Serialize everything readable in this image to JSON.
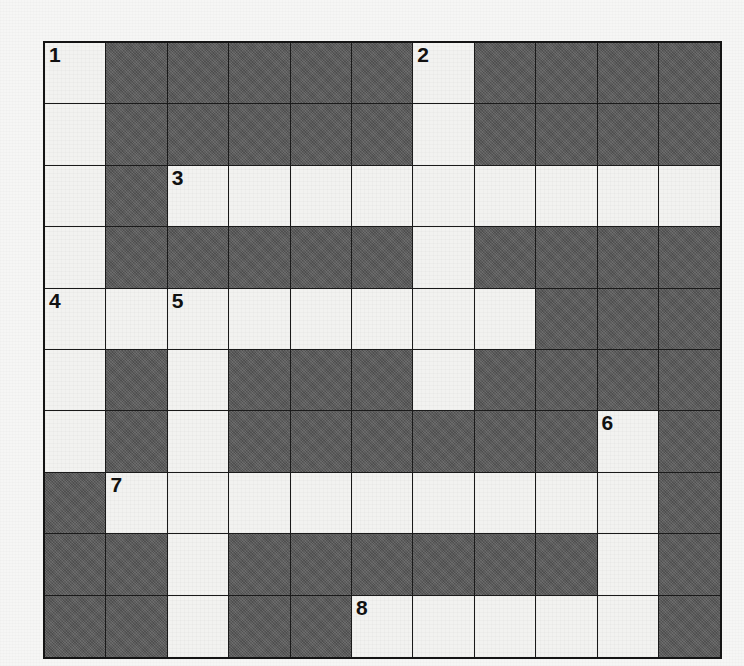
{
  "puzzle": {
    "kind": "crossword-grid",
    "rows": 10,
    "cols": 11,
    "cell_size_px": 61.4,
    "colors": {
      "open_cell": "#f2f2f0",
      "block_cell": "#595959",
      "grid_line": "#1a1a1a",
      "outer_border": "#141414",
      "page_background": "#f6f6f5",
      "number_text": "#111111"
    },
    "legend": {
      "open": "letter cell (white)",
      "block": "blocked cell (dark gray)"
    },
    "grid": [
      [
        "open",
        "block",
        "block",
        "block",
        "block",
        "block",
        "open",
        "block",
        "block",
        "block",
        "block"
      ],
      [
        "open",
        "block",
        "block",
        "block",
        "block",
        "block",
        "open",
        "block",
        "block",
        "block",
        "block"
      ],
      [
        "open",
        "block",
        "open",
        "open",
        "open",
        "open",
        "open",
        "open",
        "open",
        "open",
        "open"
      ],
      [
        "open",
        "block",
        "block",
        "block",
        "block",
        "block",
        "open",
        "block",
        "block",
        "block",
        "block"
      ],
      [
        "open",
        "open",
        "open",
        "open",
        "open",
        "open",
        "open",
        "open",
        "block",
        "block",
        "block"
      ],
      [
        "open",
        "block",
        "open",
        "block",
        "block",
        "block",
        "open",
        "block",
        "block",
        "block",
        "block"
      ],
      [
        "open",
        "block",
        "open",
        "block",
        "block",
        "block",
        "block",
        "block",
        "block",
        "open",
        "block"
      ],
      [
        "block",
        "open",
        "open",
        "open",
        "open",
        "open",
        "open",
        "open",
        "open",
        "open",
        "block"
      ],
      [
        "block",
        "block",
        "open",
        "block",
        "block",
        "block",
        "block",
        "block",
        "block",
        "open",
        "block"
      ],
      [
        "block",
        "block",
        "open",
        "block",
        "block",
        "open",
        "open",
        "open",
        "open",
        "open",
        "block"
      ]
    ],
    "clue_numbers": [
      {
        "number": "1",
        "row": 0,
        "col": 0
      },
      {
        "number": "2",
        "row": 0,
        "col": 6
      },
      {
        "number": "3",
        "row": 2,
        "col": 2
      },
      {
        "number": "4",
        "row": 4,
        "col": 0
      },
      {
        "number": "5",
        "row": 4,
        "col": 2
      },
      {
        "number": "6",
        "row": 6,
        "col": 9
      },
      {
        "number": "7",
        "row": 7,
        "col": 1
      },
      {
        "number": "8",
        "row": 9,
        "col": 5
      }
    ]
  }
}
